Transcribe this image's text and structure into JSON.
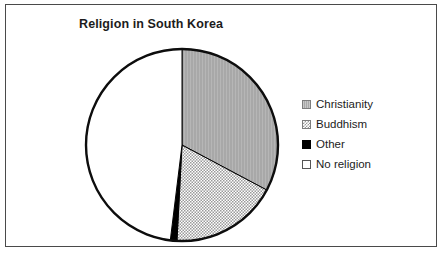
{
  "chart_data": {
    "type": "pie",
    "title": "Religion in South Korea",
    "xlabel": "",
    "ylabel": "",
    "grid": false,
    "legend_position": "right",
    "categories": [
      "Christianity",
      "Buddhism",
      "Other",
      "No religion"
    ],
    "values": [
      32.8,
      18.1,
      1.1,
      48.0
    ],
    "units": "percent",
    "slices": [
      {
        "label": "Christianity",
        "value": 32.8,
        "start_angle_deg": 0,
        "end_angle_deg": 118,
        "fill": "solid-gray-vertical-striae",
        "color": "#a8a8a8"
      },
      {
        "label": "Buddhism",
        "value": 18.1,
        "start_angle_deg": 118,
        "end_angle_deg": 183,
        "fill": "fine-checker",
        "color": "#9a9a9a"
      },
      {
        "label": "Other",
        "value": 1.1,
        "start_angle_deg": 183,
        "end_angle_deg": 187,
        "fill": "solid-black",
        "color": "#000000"
      },
      {
        "label": "No religion",
        "value": 48.0,
        "start_angle_deg": 187,
        "end_angle_deg": 360,
        "fill": "white",
        "color": "#ffffff"
      }
    ],
    "outline_color": "#000000"
  },
  "legend": {
    "items": [
      {
        "label": "Christianity",
        "swatch": "solid-gray-swatch"
      },
      {
        "label": "Buddhism",
        "swatch": "checker-swatch"
      },
      {
        "label": "Other",
        "swatch": "black-swatch"
      },
      {
        "label": "No religion",
        "swatch": "white-swatch"
      }
    ]
  },
  "style": {
    "frame_border_color": "#4a4a4a",
    "background": "#ffffff",
    "title_color": "#1c1c1c",
    "label_color": "#1c1c1c"
  }
}
